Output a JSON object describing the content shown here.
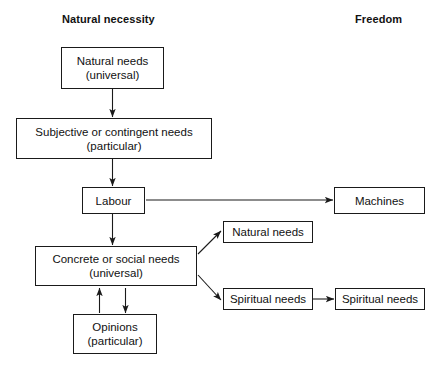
{
  "diagram": {
    "title_left": "Natural necessity",
    "title_right": "Freedom",
    "nodes": {
      "natural_needs_universal": {
        "line1": "Natural needs",
        "line2": "(universal)"
      },
      "subjective_contingent": {
        "line1": "Subjective or contingent needs",
        "line2": "(particular)"
      },
      "labour": {
        "line1": "Labour",
        "line2": ""
      },
      "machines": {
        "line1": "Machines",
        "line2": ""
      },
      "concrete_social": {
        "line1": "Concrete or social needs",
        "line2": "(universal)"
      },
      "opinions": {
        "line1": "Opinions",
        "line2": "(particular)"
      },
      "natural_needs_right": {
        "line1": "Natural needs",
        "line2": ""
      },
      "spiritual_needs_1": {
        "line1": "Spiritual needs",
        "line2": ""
      },
      "spiritual_needs_2": {
        "line1": "Spiritual needs",
        "line2": ""
      }
    },
    "edges": [
      {
        "name": "natural-needs-to-subjective",
        "kind": "arrow-down"
      },
      {
        "name": "subjective-to-labour",
        "kind": "arrow-down"
      },
      {
        "name": "labour-to-machines",
        "kind": "arrow-right"
      },
      {
        "name": "labour-to-concrete",
        "kind": "arrow-down"
      },
      {
        "name": "concrete-to-natural-needs-right",
        "kind": "arrow-diagonal-up-right"
      },
      {
        "name": "concrete-to-spiritual-needs",
        "kind": "arrow-diagonal-down-right"
      },
      {
        "name": "spiritual-to-spiritual",
        "kind": "arrow-right"
      },
      {
        "name": "opinions-to-concrete",
        "kind": "arrow-up"
      },
      {
        "name": "concrete-to-opinions",
        "kind": "arrow-down"
      }
    ],
    "colors": {
      "ink": "#111111",
      "stroke": "#1a1a1a",
      "background": "#ffffff"
    }
  }
}
